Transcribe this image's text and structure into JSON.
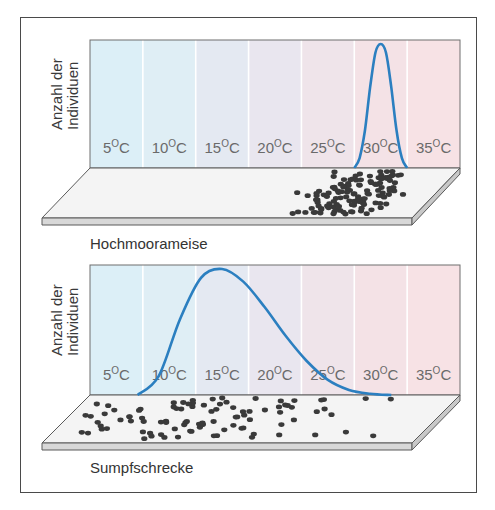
{
  "figure": {
    "y_axis_label_line1": "Anzahl der",
    "y_axis_label_line2": "Individuen",
    "temperature_labels": [
      "5",
      "10",
      "15",
      "20",
      "25",
      "30",
      "35"
    ],
    "temperature_unit_sup": "O",
    "temperature_unit": "C",
    "column_colors": [
      "#dcefF7",
      "#dfeef5",
      "#e4e9f2",
      "#e9e6ef",
      "#efe4ea",
      "#f4e2e6",
      "#f7e2e5"
    ],
    "curve_color": "#2b7fc0",
    "dot_color": "#3a3a3a"
  },
  "chart_data": [
    {
      "type": "line",
      "title": "Hochmoorameise",
      "ylabel": "Anzahl der Individuen",
      "xlabel": "",
      "x_categories": [
        "5°C",
        "10°C",
        "15°C",
        "20°C",
        "25°C",
        "30°C",
        "35°C"
      ],
      "xlim": [
        2.5,
        37.5
      ],
      "ylim": [
        0,
        1
      ],
      "series": [
        {
          "name": "Hochmoorameise",
          "x": [
            27.5,
            28.0,
            28.5,
            29.0,
            29.5,
            30.0,
            30.5,
            31.0,
            31.5,
            32.0,
            32.5
          ],
          "y": [
            0.0,
            0.08,
            0.3,
            0.65,
            0.93,
            1.0,
            0.93,
            0.65,
            0.3,
            0.08,
            0.0
          ]
        }
      ],
      "distribution_dots": {
        "count": 130,
        "center_celsius": 30,
        "spread_celsius": 2.2
      }
    },
    {
      "type": "line",
      "title": "Sumpfschrecke",
      "ylabel": "Anzahl der Individuen",
      "xlabel": "",
      "x_categories": [
        "5°C",
        "10°C",
        "15°C",
        "20°C",
        "25°C",
        "30°C",
        "35°C"
      ],
      "xlim": [
        2.5,
        37.5
      ],
      "ylim": [
        0,
        1
      ],
      "series": [
        {
          "name": "Sumpfschrecke",
          "x": [
            7.0,
            9.0,
            11.0,
            13.0,
            15.0,
            17.0,
            19.0,
            21.0,
            23.0,
            25.0,
            27.0,
            29.0,
            31.0
          ],
          "y": [
            0.0,
            0.15,
            0.6,
            0.93,
            1.0,
            0.9,
            0.7,
            0.47,
            0.27,
            0.12,
            0.04,
            0.01,
            0.0
          ]
        }
      ],
      "distribution_dots": {
        "count": 95,
        "center_celsius": 15,
        "spread_celsius": 6.5
      }
    }
  ]
}
